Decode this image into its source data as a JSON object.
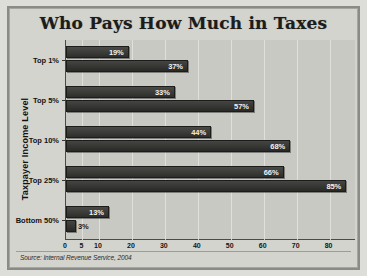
{
  "chart_data": {
    "type": "bar",
    "orientation": "horizontal",
    "title": "Who Pays How Much in Taxes",
    "xlabel": "",
    "ylabel": "Taxpayer Income Level",
    "categories": [
      "Top 1%",
      "Top 5%",
      "Top 10%",
      "Top 25%",
      "Bottom 50%"
    ],
    "series": [
      {
        "name": "Share of income",
        "values": [
          19,
          33,
          44,
          66,
          13
        ],
        "labels": [
          "19%",
          "33%",
          "44%",
          "66%",
          "13%"
        ],
        "color": "#2e2e2c"
      },
      {
        "name": "Share of total U.S. federal income tax bill",
        "values": [
          37,
          57,
          68,
          85,
          3
        ],
        "labels": [
          "37%",
          "57%",
          "68%",
          "85%",
          "3%"
        ],
        "color": "#292927"
      }
    ],
    "xlim": [
      0,
      88
    ],
    "xticks": [
      0,
      5,
      10,
      20,
      30,
      40,
      50,
      60,
      70,
      80
    ],
    "xtick_labels": [
      "0",
      "5",
      "10",
      "20",
      "30",
      "40",
      "50",
      "60",
      "70",
      "80"
    ],
    "grid": true,
    "legend_position": "top-right",
    "source": "Source: Internal Revenue Service, 2004"
  },
  "colors": {
    "bar_dark": "#2e2e2c",
    "plot_background": "#c9c9c4",
    "page_background": "#d4d4cf",
    "frame": "#8a8a86",
    "axis": "#4a4a47",
    "value_text": "#f2f2ee"
  }
}
